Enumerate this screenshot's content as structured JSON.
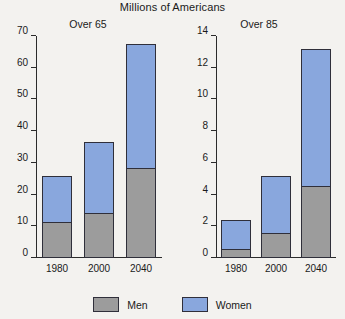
{
  "title": "Millions of Americans",
  "legend": {
    "men_label": "Men",
    "women_label": "Women",
    "men_color": "#9c9c9c",
    "women_color": "#89a7dd"
  },
  "panels": [
    {
      "title": "Over 65",
      "yticks": [
        "0",
        "10",
        "20",
        "30",
        "40",
        "50",
        "60",
        "70"
      ],
      "xlabels": [
        "1980",
        "2000",
        "2040"
      ]
    },
    {
      "title": "Over 85",
      "yticks": [
        "0",
        "2",
        "4",
        "6",
        "8",
        "10",
        "12",
        "14"
      ],
      "xlabels": [
        "1980",
        "2000",
        "2040"
      ]
    }
  ],
  "chart_data": [
    {
      "type": "bar",
      "stacked": true,
      "title": "Over 65",
      "subtitle": "Millions of Americans",
      "categories": [
        "1980",
        "2000",
        "2040"
      ],
      "series": [
        {
          "name": "Men",
          "color": "#9c9c9c",
          "values": [
            11,
            14,
            28
          ]
        },
        {
          "name": "Women",
          "color": "#89a7dd",
          "values": [
            15,
            22.5,
            39.5
          ]
        }
      ],
      "totals": [
        26,
        36.5,
        67.5
      ],
      "xlabel": "",
      "ylabel": "",
      "ylim": [
        0,
        70
      ],
      "ytick_step": 10,
      "grid": false,
      "legend_position": "bottom"
    },
    {
      "type": "bar",
      "stacked": true,
      "title": "Over 85",
      "subtitle": "Millions of Americans",
      "categories": [
        "1980",
        "2000",
        "2040"
      ],
      "series": [
        {
          "name": "Men",
          "color": "#9c9c9c",
          "values": [
            0.5,
            1.5,
            4.5
          ]
        },
        {
          "name": "Women",
          "color": "#89a7dd",
          "values": [
            1.9,
            3.7,
            8.7
          ]
        }
      ],
      "totals": [
        2.4,
        5.2,
        13.2
      ],
      "xlabel": "",
      "ylabel": "",
      "ylim": [
        0,
        14
      ],
      "ytick_step": 2,
      "grid": false,
      "legend_position": "bottom"
    }
  ]
}
